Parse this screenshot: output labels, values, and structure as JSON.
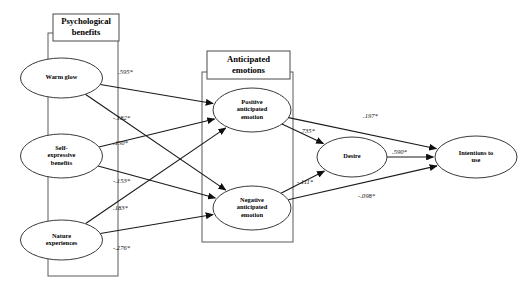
{
  "diagram": {
    "type": "structural-equation-model",
    "title": "",
    "groups": [
      {
        "id": "psychological-benefits",
        "label": "Psychological benefits",
        "label_line1": "Psychological",
        "label_line2": "benefits",
        "frame": {
          "x": 48,
          "y": 33,
          "w": 70,
          "h": 243
        },
        "header": {
          "x": 53,
          "y": 14,
          "w": 66,
          "h": 27
        }
      },
      {
        "id": "anticipated-emotions",
        "label": "Anticipated emotions",
        "label_line1": "Anticipated",
        "label_line2": "emotions",
        "frame": {
          "x": 202,
          "y": 72,
          "w": 91,
          "h": 170
        },
        "header": {
          "x": 207,
          "y": 51,
          "w": 83,
          "h": 28
        }
      }
    ],
    "nodes": [
      {
        "id": "warm-glow",
        "label": "Warm glow",
        "lines": [
          "Warm glow"
        ],
        "cx": 61.5,
        "cy": 78,
        "rx": 41,
        "ry": 20
      },
      {
        "id": "self-expressive-benefits",
        "label": "Self-expressive benefits",
        "lines": [
          "Self-",
          "expressive",
          "benefits"
        ],
        "cx": 61.5,
        "cy": 156,
        "rx": 41,
        "ry": 22
      },
      {
        "id": "nature-experiences",
        "label": "Nature experiences",
        "lines": [
          "Nature",
          "experiences"
        ],
        "cx": 61.5,
        "cy": 240,
        "rx": 41,
        "ry": 20
      },
      {
        "id": "positive-anticipated-emotion",
        "label": "Positive anticipated emotion",
        "lines": [
          "Positive",
          "anticipated",
          "emotion"
        ],
        "cx": 252,
        "cy": 110,
        "rx": 39,
        "ry": 22
      },
      {
        "id": "negative-anticipated-emotion",
        "label": "Negative anticipated emotion",
        "lines": [
          "Negative",
          "anticipated",
          "emotion"
        ],
        "cx": 252,
        "cy": 208,
        "rx": 39,
        "ry": 22
      },
      {
        "id": "desire",
        "label": "Desire",
        "lines": [
          "Desire"
        ],
        "cx": 352,
        "cy": 157,
        "rx": 35,
        "ry": 20
      },
      {
        "id": "intentions-to-use",
        "label": "Intentions to use",
        "lines": [
          "Intentions to",
          "use"
        ],
        "cx": 476,
        "cy": 157,
        "rx": 41,
        "ry": 21
      }
    ],
    "paths": [
      {
        "id": "warm-glow-to-positive",
        "from": "warm-glow",
        "to": "positive-anticipated-emotion",
        "coefficient": ".595*",
        "label_x": 118,
        "label_y": 72
      },
      {
        "id": "warm-glow-to-negative",
        "from": "warm-glow",
        "to": "negative-anticipated-emotion",
        "coefficient": "-.182*",
        "label_x": 113,
        "label_y": 118
      },
      {
        "id": "self-expressive-to-positive",
        "from": "self-expressive-benefits",
        "to": "positive-anticipated-emotion",
        "coefficient": ".150*",
        "label_x": 113,
        "label_y": 143
      },
      {
        "id": "self-expressive-to-negative",
        "from": "self-expressive-benefits",
        "to": "negative-anticipated-emotion",
        "coefficient": "-.153*",
        "label_x": 113,
        "label_y": 181
      },
      {
        "id": "nature-to-positive",
        "from": "nature-experiences",
        "to": "positive-anticipated-emotion",
        "coefficient": ".183*",
        "label_x": 113,
        "label_y": 208
      },
      {
        "id": "nature-to-negative",
        "from": "nature-experiences",
        "to": "negative-anticipated-emotion",
        "coefficient": "-.276*",
        "label_x": 113,
        "label_y": 248
      },
      {
        "id": "positive-to-desire",
        "from": "positive-anticipated-emotion",
        "to": "desire",
        "coefficient": ".735*",
        "label_x": 300,
        "label_y": 131
      },
      {
        "id": "negative-to-desire",
        "from": "negative-anticipated-emotion",
        "to": "desire",
        "coefficient": "-.111*",
        "label_x": 297,
        "label_y": 182
      },
      {
        "id": "positive-to-intentions",
        "from": "positive-anticipated-emotion",
        "to": "intentions-to-use",
        "coefficient": ".197*",
        "label_x": 363,
        "label_y": 116
      },
      {
        "id": "desire-to-intentions",
        "from": "desire",
        "to": "intentions-to-use",
        "coefficient": ".590*",
        "label_x": 392,
        "label_y": 152
      },
      {
        "id": "negative-to-intentions",
        "from": "negative-anticipated-emotion",
        "to": "intentions-to-use",
        "coefficient": "-.098*",
        "label_x": 358,
        "label_y": 196
      }
    ]
  },
  "chart_data": {
    "type": "diagram",
    "nodes": [
      "Warm glow",
      "Self-expressive benefits",
      "Nature experiences",
      "Positive anticipated emotion",
      "Negative anticipated emotion",
      "Desire",
      "Intentions to use"
    ],
    "groups": [
      "Psychological benefits",
      "Anticipated emotions"
    ],
    "edges": [
      {
        "source": "Warm glow",
        "target": "Positive anticipated emotion",
        "value": 0.595,
        "label": ".595*",
        "significant": true
      },
      {
        "source": "Warm glow",
        "target": "Negative anticipated emotion",
        "value": -0.182,
        "label": "-.182*",
        "significant": true
      },
      {
        "source": "Self-expressive benefits",
        "target": "Positive anticipated emotion",
        "value": 0.15,
        "label": ".150*",
        "significant": true
      },
      {
        "source": "Self-expressive benefits",
        "target": "Negative anticipated emotion",
        "value": -0.153,
        "label": "-.153*",
        "significant": true
      },
      {
        "source": "Nature experiences",
        "target": "Positive anticipated emotion",
        "value": 0.183,
        "label": ".183*",
        "significant": true
      },
      {
        "source": "Nature experiences",
        "target": "Negative anticipated emotion",
        "value": -0.276,
        "label": "-.276*",
        "significant": true
      },
      {
        "source": "Positive anticipated emotion",
        "target": "Desire",
        "value": 0.735,
        "label": ".735*",
        "significant": true
      },
      {
        "source": "Negative anticipated emotion",
        "target": "Desire",
        "value": -0.111,
        "label": "-.111*",
        "significant": true
      },
      {
        "source": "Positive anticipated emotion",
        "target": "Intentions to use",
        "value": 0.197,
        "label": ".197*",
        "significant": true
      },
      {
        "source": "Desire",
        "target": "Intentions to use",
        "value": 0.59,
        "label": ".590*",
        "significant": true
      },
      {
        "source": "Negative anticipated emotion",
        "target": "Intentions to use",
        "value": -0.098,
        "label": "-.098*",
        "significant": true
      }
    ]
  }
}
